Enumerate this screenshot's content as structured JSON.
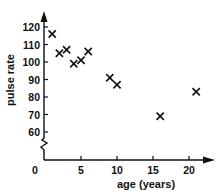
{
  "chart_data": {
    "type": "scatter",
    "title": "",
    "xlabel": "age (years)",
    "ylabel": "pulse rate",
    "xlim": [
      0,
      23
    ],
    "ylim": [
      60,
      125
    ],
    "y_axis_break": true,
    "grid": false,
    "legend": null,
    "x_ticks": [
      0,
      5,
      10,
      15,
      20
    ],
    "y_ticks": [
      60,
      70,
      80,
      90,
      100,
      110,
      120
    ],
    "marker": "x",
    "points": [
      {
        "x": 1,
        "y": 116
      },
      {
        "x": 2,
        "y": 105
      },
      {
        "x": 3,
        "y": 107
      },
      {
        "x": 4,
        "y": 99
      },
      {
        "x": 5,
        "y": 101
      },
      {
        "x": 6,
        "y": 106
      },
      {
        "x": 9,
        "y": 91
      },
      {
        "x": 10,
        "y": 87
      },
      {
        "x": 16,
        "y": 69
      },
      {
        "x": 21,
        "y": 83
      }
    ]
  },
  "colors": {
    "ink": "#111111",
    "background": "#ffffff"
  }
}
